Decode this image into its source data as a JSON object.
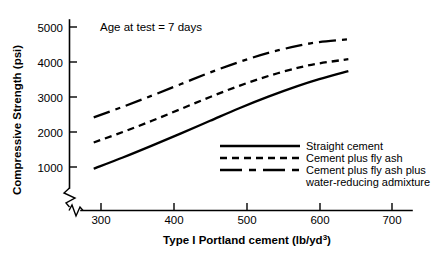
{
  "chart_data": {
    "type": "line",
    "title": "",
    "annotation": "Age at test = 7 days",
    "xlabel": "Type I Portland cement (lb/yd",
    "xlabel_sup": "3",
    "xlabel_tail": ")",
    "ylabel": "Compressive Strength (psi)",
    "xlim": [
      265,
      730
    ],
    "ylim": [
      600,
      5300
    ],
    "axis_break_x": true,
    "axis_break_y": true,
    "grid": false,
    "legend_position": "inside lower-right",
    "xticks": [
      300,
      400,
      500,
      600,
      700
    ],
    "xticklabels": [
      "300",
      "400",
      "500",
      "600",
      "700"
    ],
    "yticks": [
      1000,
      2000,
      3000,
      4000,
      5000
    ],
    "yticklabels": [
      "1000",
      "2000",
      "3000",
      "4000",
      "5000"
    ],
    "series": [
      {
        "name": "Straight cement",
        "style": "solid",
        "x": [
          290,
          330,
          370,
          410,
          450,
          490,
          530,
          570,
          600,
          640
        ],
        "y": [
          950,
          1270,
          1610,
          1960,
          2320,
          2680,
          3010,
          3310,
          3510,
          3740
        ]
      },
      {
        "name": "Cement plus fly ash",
        "style": "dashed",
        "x": [
          290,
          330,
          370,
          410,
          450,
          490,
          530,
          570,
          600,
          640
        ],
        "y": [
          1700,
          2000,
          2320,
          2660,
          3000,
          3320,
          3600,
          3830,
          3960,
          4080
        ]
      },
      {
        "name": "Cement plus fly ash plus water-reducing admixture",
        "style": "dashdot",
        "x": [
          290,
          330,
          370,
          410,
          450,
          490,
          530,
          570,
          600,
          640
        ],
        "y": [
          2420,
          2720,
          3040,
          3370,
          3700,
          4000,
          4260,
          4460,
          4570,
          4650
        ]
      }
    ]
  },
  "legend": {
    "items": [
      {
        "label": "Straight cement",
        "style": "solid"
      },
      {
        "label": "Cement plus fly ash",
        "style": "dashed"
      },
      {
        "label": "Cement plus fly ash plus",
        "style": "dashdot"
      },
      {
        "label": "water-reducing admixture",
        "style": "none"
      }
    ]
  }
}
